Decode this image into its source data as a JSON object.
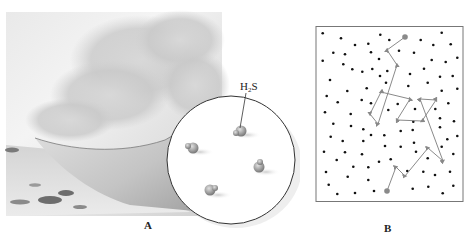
{
  "figure": {
    "panel_a": {
      "label": "A",
      "scene": "photograph of volcanic steam plume over ground, peeled back to reveal magnified view of gas molecules",
      "magnifier": {
        "molecule_label": "H",
        "molecule_label_sub": "2",
        "molecule_label_tail": "S",
        "molecule_count": 4
      }
    },
    "panel_b": {
      "label": "B",
      "description": "random walk path of a molecule through a field of particles",
      "path_color": "#888888",
      "dot_color": "#111111",
      "endpoint_color": "#8a8a8a"
    }
  }
}
